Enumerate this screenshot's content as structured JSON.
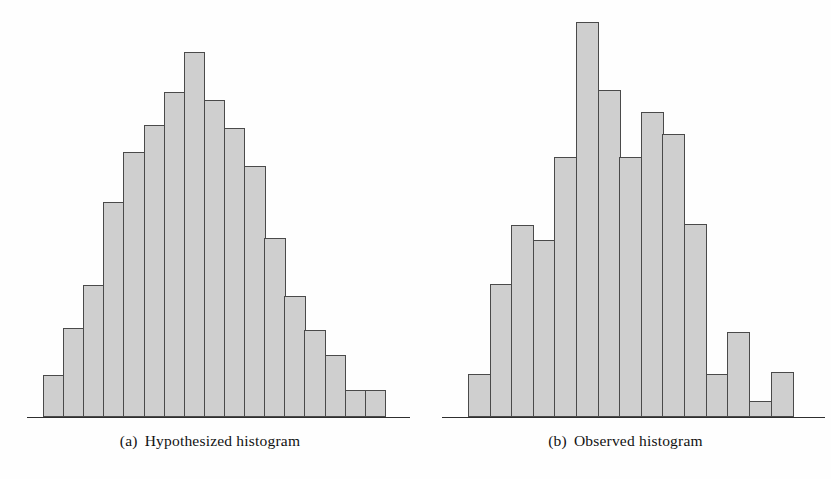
{
  "figure": {
    "background_color": "#fefefe",
    "bar_fill_color": "#cfcfcf",
    "bar_border_color": "#4a4a4a",
    "axis_color": "#2e2e2e"
  },
  "panels": [
    {
      "id": "hypothesized",
      "caption_tag": "(a)",
      "caption_text": "Hypothesized histogram"
    },
    {
      "id": "observed",
      "caption_tag": "(b)",
      "caption_text": "Observed histogram"
    }
  ],
  "chart_data": [
    {
      "type": "bar",
      "title": "(a)  Hypothesized histogram",
      "xlabel": "",
      "ylabel": "",
      "grid": false,
      "legend": "none",
      "axis": {
        "x_axis_visible": true,
        "y_axis_visible": false
      },
      "categories": [
        "1",
        "2",
        "3",
        "4",
        "5",
        "6",
        "7",
        "8",
        "9",
        "10",
        "11",
        "12",
        "13",
        "14",
        "15",
        "16",
        "17"
      ],
      "values": [
        42,
        89,
        132,
        215,
        265,
        292,
        325,
        365,
        317,
        289,
        251,
        179,
        121,
        87,
        62,
        27,
        27
      ],
      "ylim": [
        0,
        400
      ],
      "bar_count": 17,
      "bar_width_px": 21.5,
      "plot_left_px": 43,
      "baseline_y_px": 417,
      "axis_left_px": 27,
      "axis_right_px": 410
    },
    {
      "type": "bar",
      "title": "(b)  Observed histogram",
      "xlabel": "",
      "ylabel": "",
      "grid": false,
      "legend": "none",
      "axis": {
        "x_axis_visible": true,
        "y_axis_visible": false
      },
      "categories": [
        "1",
        "2",
        "3",
        "4",
        "5",
        "6",
        "7",
        "8",
        "9",
        "10",
        "11",
        "12",
        "13",
        "14",
        "15",
        "16"
      ],
      "values": [
        43,
        133,
        192,
        177,
        260,
        395,
        327,
        260,
        305,
        283,
        193,
        43,
        85,
        16,
        45,
        0
      ],
      "ylim": [
        0,
        400
      ],
      "bar_count": 16,
      "bar_width_px": 23,
      "plot_left_px": 48,
      "baseline_y_px": 417,
      "axis_left_px": 22,
      "axis_right_px": 405
    }
  ]
}
